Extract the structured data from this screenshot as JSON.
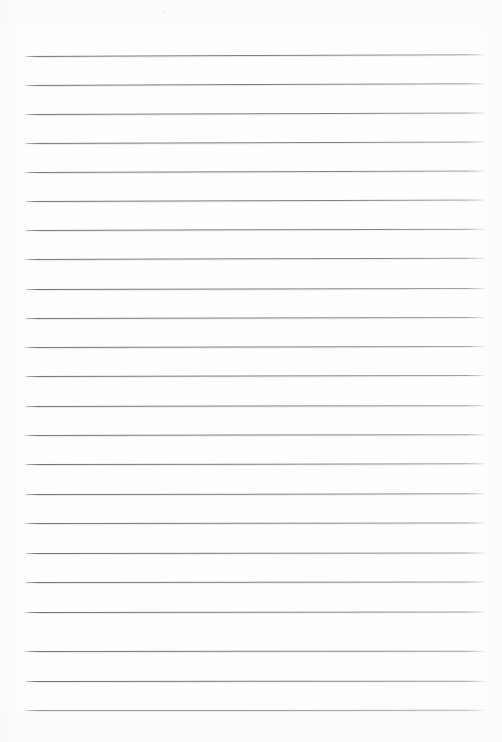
{
  "document": {
    "type": "lined-notebook-page",
    "title": "Lined notebook page",
    "description": "Blank ruled writing paper, scanned",
    "page_width": 502,
    "page_height": 742,
    "background_color": "#fefefe",
    "has_text_content": false,
    "written_text": ""
  },
  "ruling": {
    "line_color": "#707070",
    "line_count": 23,
    "line_thickness": 1,
    "line_spacing": 29.2,
    "first_line_y": 56,
    "last_line_y": 710,
    "line_left_x": 24,
    "line_right_x": 484,
    "line_length": 460,
    "margin_top": 56,
    "margin_bottom": 32,
    "margin_left": 24,
    "margin_right": 18,
    "lines": [
      {
        "index": 1,
        "y": 56,
        "left": 24,
        "right": 484,
        "tilt": -0.22
      },
      {
        "index": 2,
        "y": 85,
        "left": 24,
        "right": 484,
        "tilt": -0.22
      },
      {
        "index": 3,
        "y": 114,
        "left": 24,
        "right": 484,
        "tilt": -0.2
      },
      {
        "index": 4,
        "y": 143,
        "left": 24,
        "right": 484,
        "tilt": -0.2
      },
      {
        "index": 5,
        "y": 172,
        "left": 24,
        "right": 484,
        "tilt": -0.18
      },
      {
        "index": 6,
        "y": 201,
        "left": 24,
        "right": 484,
        "tilt": -0.18
      },
      {
        "index": 7,
        "y": 230,
        "left": 24,
        "right": 484,
        "tilt": -0.16
      },
      {
        "index": 8,
        "y": 259,
        "left": 24,
        "right": 484,
        "tilt": -0.16
      },
      {
        "index": 9,
        "y": 289,
        "left": 24,
        "right": 484,
        "tilt": -0.14
      },
      {
        "index": 10,
        "y": 318,
        "left": 24,
        "right": 484,
        "tilt": -0.14
      },
      {
        "index": 11,
        "y": 347,
        "left": 24,
        "right": 484,
        "tilt": -0.12
      },
      {
        "index": 12,
        "y": 376,
        "left": 24,
        "right": 484,
        "tilt": -0.12
      },
      {
        "index": 13,
        "y": 406,
        "left": 24,
        "right": 484,
        "tilt": -0.1
      },
      {
        "index": 14,
        "y": 435,
        "left": 24,
        "right": 484,
        "tilt": -0.1
      },
      {
        "index": 15,
        "y": 464,
        "left": 24,
        "right": 484,
        "tilt": -0.08
      },
      {
        "index": 16,
        "y": 494,
        "left": 24,
        "right": 484,
        "tilt": -0.08
      },
      {
        "index": 17,
        "y": 523,
        "left": 24,
        "right": 484,
        "tilt": -0.06
      },
      {
        "index": 18,
        "y": 553,
        "left": 24,
        "right": 484,
        "tilt": -0.06
      },
      {
        "index": 19,
        "y": 582,
        "left": 24,
        "right": 484,
        "tilt": -0.05
      },
      {
        "index": 20,
        "y": 612,
        "left": 24,
        "right": 484,
        "tilt": -0.05
      },
      {
        "index": 21,
        "y": 651,
        "left": 24,
        "right": 484,
        "tilt": -0.04
      },
      {
        "index": 22,
        "y": 681,
        "left": 24,
        "right": 484,
        "tilt": -0.04
      },
      {
        "index": 23,
        "y": 710,
        "left": 24,
        "right": 484,
        "tilt": -0.03
      }
    ]
  },
  "artifacts": {
    "speck": {
      "x": 163,
      "y": 11,
      "color": "#e8e8e8"
    }
  }
}
